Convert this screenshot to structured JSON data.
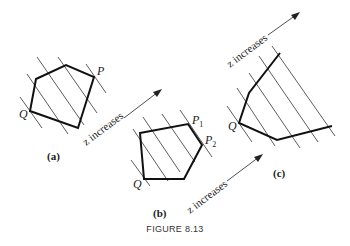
{
  "figure": {
    "title": "FIGURE 8.13",
    "arrow_label": "z increases",
    "panels": [
      {
        "id": "a",
        "caption": "(a)",
        "vertex_labels": [
          "P",
          "Q"
        ]
      },
      {
        "id": "b",
        "caption": "(b)",
        "vertex_labels": [
          "P",
          "1",
          "P",
          "2",
          "Q"
        ]
      },
      {
        "id": "c",
        "caption": "(c)",
        "vertex_labels": [
          "Q"
        ]
      }
    ]
  }
}
